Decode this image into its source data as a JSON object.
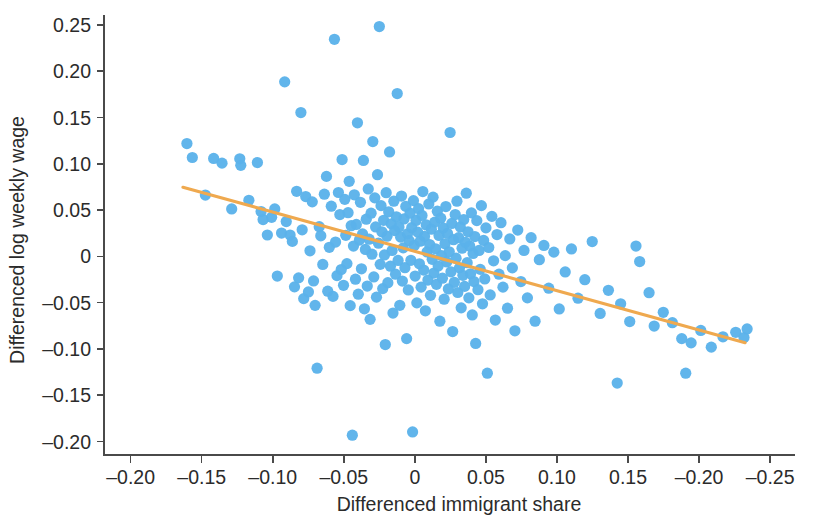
{
  "chart_data": {
    "type": "scatter",
    "title": "",
    "xlabel": "Differenced immigrant share",
    "ylabel": "Differenced log weekly wage",
    "xlim": [
      -0.21875,
      0.2675
    ],
    "ylim": [
      -0.2145,
      0.2607
    ],
    "grid": false,
    "legend": null,
    "point_color": "#5BB2EA",
    "line_color": "#EFA94F",
    "axis_color": "#4A4A4A",
    "text_color": "#2B2B2B",
    "xticks": [
      -0.2,
      -0.15,
      -0.1,
      -0.05,
      0,
      0.05,
      0.1,
      0.15,
      0.2,
      0.25
    ],
    "xtick_labels": [
      "–0.20",
      "–0.15",
      "–0.10",
      "–0.05",
      "0",
      "0.05",
      "0.10",
      "0.15",
      "–0.20",
      "–0.25"
    ],
    "yticks": [
      0.25,
      0.2,
      0.15,
      0.1,
      0.05,
      0,
      -0.05,
      -0.1,
      -0.15,
      -0.2
    ],
    "ytick_labels": [
      "0.25",
      "0.20",
      "0.15",
      "0.10",
      "0.05",
      "0",
      "–0.05",
      "–0.10",
      "–0.15",
      "–0.20"
    ],
    "marker_size": 7.4,
    "fit_line": {
      "label": "linear fit",
      "x_start": -0.1632,
      "y_start": 0.0747,
      "x_end": 0.2324,
      "y_end": -0.0932,
      "slope": -0.4245,
      "intercept": 0.0054
    },
    "series": [
      {
        "name": "labor market cells",
        "n_points": 260,
        "points": [
          [
            -0.1604,
            0.1219
          ],
          [
            -0.1566,
            0.1068
          ],
          [
            -0.1474,
            0.0662
          ],
          [
            -0.1416,
            0.1058
          ],
          [
            -0.1357,
            0.1007
          ],
          [
            -0.1289,
            0.0512
          ],
          [
            -0.1232,
            0.1054
          ],
          [
            -0.1225,
            0.0983
          ],
          [
            -0.1168,
            0.0606
          ],
          [
            -0.1108,
            0.1013
          ],
          [
            -0.1082,
            0.0484
          ],
          [
            -0.1068,
            0.0398
          ],
          [
            -0.1038,
            0.0231
          ],
          [
            -0.1008,
            0.0422
          ],
          [
            -0.0986,
            0.0512
          ],
          [
            -0.0968,
            -0.0212
          ],
          [
            -0.0938,
            0.0252
          ],
          [
            -0.0916,
            0.1885
          ],
          [
            -0.0905,
            0.0376
          ],
          [
            -0.0878,
            0.0231
          ],
          [
            -0.0862,
            0.0162
          ],
          [
            -0.0847,
            -0.0329
          ],
          [
            -0.0832,
            0.0703
          ],
          [
            -0.0818,
            -0.0232
          ],
          [
            -0.0802,
            0.1553
          ],
          [
            -0.0793,
            0.0287
          ],
          [
            -0.0782,
            -0.0456
          ],
          [
            -0.0768,
            0.0646
          ],
          [
            -0.0749,
            -0.0384
          ],
          [
            -0.0738,
            0.006
          ],
          [
            -0.0722,
            0.0589
          ],
          [
            -0.0713,
            -0.0265
          ],
          [
            -0.0702,
            -0.0529
          ],
          [
            -0.0688,
            -0.1208
          ],
          [
            -0.0673,
            0.0321
          ],
          [
            -0.0662,
            0.0222
          ],
          [
            -0.0648,
            -0.0087
          ],
          [
            -0.0637,
            0.0672
          ],
          [
            -0.0622,
            0.0864
          ],
          [
            -0.0613,
            -0.0376
          ],
          [
            -0.0602,
            0.0098
          ],
          [
            -0.0588,
            0.0542
          ],
          [
            -0.0576,
            -0.0432
          ],
          [
            -0.0566,
            0.2345
          ],
          [
            -0.0558,
            0.0155
          ],
          [
            -0.0548,
            -0.0208
          ],
          [
            -0.0538,
            0.069
          ],
          [
            -0.0528,
            0.0452
          ],
          [
            -0.0518,
            -0.0142
          ],
          [
            -0.0512,
            0.1046
          ],
          [
            -0.0502,
            -0.0312
          ],
          [
            -0.0493,
            0.0616
          ],
          [
            -0.0486,
            0.0228
          ],
          [
            -0.0478,
            -0.0078
          ],
          [
            -0.047,
            0.0472
          ],
          [
            -0.0462,
            0.0811
          ],
          [
            -0.0455,
            -0.0532
          ],
          [
            -0.0448,
            0.0331
          ],
          [
            -0.044,
            -0.1931
          ],
          [
            -0.0432,
            0.0112
          ],
          [
            -0.0426,
            0.0665
          ],
          [
            -0.0418,
            -0.0246
          ],
          [
            -0.0412,
            0.0345
          ],
          [
            -0.0404,
            0.1443
          ],
          [
            -0.0398,
            -0.0408
          ],
          [
            -0.039,
            0.0176
          ],
          [
            -0.0383,
            0.0584
          ],
          [
            -0.0376,
            -0.0134
          ],
          [
            -0.0368,
            0.0242
          ],
          [
            -0.0362,
            0.1036
          ],
          [
            -0.0355,
            -0.0566
          ],
          [
            -0.0348,
            0.0075
          ],
          [
            -0.0342,
            0.0402
          ],
          [
            -0.0335,
            -0.032
          ],
          [
            -0.0328,
            0.0728
          ],
          [
            -0.0322,
            0.0186
          ],
          [
            -0.0315,
            -0.068
          ],
          [
            -0.0308,
            0.0466
          ],
          [
            -0.0302,
            0.0024
          ],
          [
            -0.0296,
            0.124
          ],
          [
            -0.0289,
            -0.0222
          ],
          [
            -0.0282,
            0.0632
          ],
          [
            -0.0276,
            0.0318
          ],
          [
            -0.027,
            -0.044
          ],
          [
            -0.0263,
            0.0882
          ],
          [
            -0.0256,
            0.0142
          ],
          [
            -0.025,
            0.2482
          ],
          [
            -0.0244,
            -0.0086
          ],
          [
            -0.0238,
            0.0548
          ],
          [
            -0.0232,
            0.0266
          ],
          [
            -0.0226,
            -0.0348
          ],
          [
            -0.022,
            0.039
          ],
          [
            -0.0214,
            0.0016
          ],
          [
            -0.0208,
            -0.0952
          ],
          [
            -0.0202,
            0.0688
          ],
          [
            -0.0196,
            0.0218
          ],
          [
            -0.019,
            -0.0284
          ],
          [
            -0.0184,
            0.0482
          ],
          [
            -0.0178,
            0.1128
          ],
          [
            -0.0172,
            -0.0106
          ],
          [
            -0.0166,
            0.0352
          ],
          [
            -0.016,
            0.0064
          ],
          [
            -0.0154,
            -0.0612
          ],
          [
            -0.0148,
            0.0596
          ],
          [
            -0.0142,
            0.0278
          ],
          [
            -0.0136,
            -0.0192
          ],
          [
            -0.013,
            0.0428
          ],
          [
            -0.0124,
            0.1759
          ],
          [
            -0.0118,
            -0.0044
          ],
          [
            -0.0112,
            0.0318
          ],
          [
            -0.0106,
            -0.0528
          ],
          [
            -0.01,
            0.0208
          ],
          [
            -0.0094,
            0.0652
          ],
          [
            -0.0088,
            -0.0266
          ],
          [
            -0.0082,
            0.0092
          ],
          [
            -0.0076,
            0.0404
          ],
          [
            -0.007,
            -0.0122
          ],
          [
            -0.0064,
            0.054
          ],
          [
            -0.0058,
            -0.0888
          ],
          [
            -0.0052,
            0.0244
          ],
          [
            -0.0046,
            -0.0362
          ],
          [
            -0.004,
            0.017
          ],
          [
            -0.0034,
            0.0466
          ],
          [
            -0.0028,
            -0.0042
          ],
          [
            -0.0022,
            0.031
          ],
          [
            -0.0016,
            -0.1896
          ],
          [
            -0.001,
            0.0602
          ],
          [
            -0.0004,
            0.0118
          ],
          [
            0.0002,
            -0.0212
          ],
          [
            0.0008,
            0.0388
          ],
          [
            0.0014,
            -0.0502
          ],
          [
            0.002,
            0.0262
          ],
          [
            0.0026,
            0.0516
          ],
          [
            0.0032,
            -0.008
          ],
          [
            0.0038,
            0.0164
          ],
          [
            0.0044,
            -0.0332
          ],
          [
            0.005,
            0.0442
          ],
          [
            0.0056,
            0.07
          ],
          [
            0.0062,
            -0.0148
          ],
          [
            0.0068,
            0.0216
          ],
          [
            0.0074,
            -0.0588
          ],
          [
            0.008,
            0.034
          ],
          [
            0.0086,
            0.0048
          ],
          [
            0.0092,
            -0.0256
          ],
          [
            0.0098,
            0.0566
          ],
          [
            0.0104,
            0.0128
          ],
          [
            0.011,
            -0.042
          ],
          [
            0.0116,
            0.0294
          ],
          [
            0.0122,
            -0.0032
          ],
          [
            0.0128,
            0.064
          ],
          [
            0.0134,
            -0.018
          ],
          [
            0.014,
            0.037
          ],
          [
            0.0146,
            0.0082
          ],
          [
            0.0152,
            -0.0302
          ],
          [
            0.0158,
            0.0488
          ],
          [
            0.0164,
            -0.0104
          ],
          [
            0.017,
            0.0226
          ],
          [
            0.0176,
            -0.07
          ],
          [
            0.0182,
            0.0412
          ],
          [
            0.0188,
            0.0008
          ],
          [
            0.0194,
            -0.0236
          ],
          [
            0.02,
            0.0306
          ],
          [
            0.0206,
            -0.0462
          ],
          [
            0.0212,
            0.0136
          ],
          [
            0.0218,
            0.0538
          ],
          [
            0.0224,
            -0.006
          ],
          [
            0.023,
            0.0248
          ],
          [
            0.0236,
            -0.0352
          ],
          [
            0.0242,
            0.005
          ],
          [
            0.0248,
            0.1338
          ],
          [
            0.0254,
            -0.0166
          ],
          [
            0.026,
            0.0356
          ],
          [
            0.0266,
            -0.0812
          ],
          [
            0.0272,
            0.018
          ],
          [
            0.0278,
            -0.028
          ],
          [
            0.0284,
            0.0452
          ],
          [
            0.029,
            -0.002
          ],
          [
            0.0296,
            0.0596
          ],
          [
            0.0302,
            -0.039
          ],
          [
            0.0308,
            0.0202
          ],
          [
            0.0314,
            -0.0124
          ],
          [
            0.032,
            0.0318
          ],
          [
            0.0326,
            -0.0556
          ],
          [
            0.0332,
            0.0088
          ],
          [
            0.0338,
            -0.0204
          ],
          [
            0.0344,
            0.0398
          ],
          [
            0.035,
            -0.0324
          ],
          [
            0.0356,
            0.0152
          ],
          [
            0.0362,
            0.0682
          ],
          [
            0.0368,
            -0.0068
          ],
          [
            0.0374,
            0.0266
          ],
          [
            0.038,
            -0.0448
          ],
          [
            0.0386,
            0.0112
          ],
          [
            0.0392,
            -0.0188
          ],
          [
            0.0398,
            0.047
          ],
          [
            0.0404,
            -0.0632
          ],
          [
            0.041,
            0.0032
          ],
          [
            0.0416,
            -0.0272
          ],
          [
            0.0422,
            0.0214
          ],
          [
            0.0428,
            -0.094
          ],
          [
            0.0436,
            0.0386
          ],
          [
            0.0444,
            -0.036
          ],
          [
            0.0452,
            0.0064
          ],
          [
            0.046,
            -0.014
          ],
          [
            0.0468,
            0.0548
          ],
          [
            0.0476,
            -0.0512
          ],
          [
            0.0484,
            0.0172
          ],
          [
            0.0492,
            -0.0244
          ],
          [
            0.05,
            0.0308
          ],
          [
            0.051,
            -0.1262
          ],
          [
            0.052,
            0.0096
          ],
          [
            0.053,
            -0.0416
          ],
          [
            0.0542,
            0.0432
          ],
          [
            0.0554,
            -0.0048
          ],
          [
            0.0566,
            -0.0688
          ],
          [
            0.0578,
            0.0236
          ],
          [
            0.0592,
            -0.0192
          ],
          [
            0.0606,
            0.0364
          ],
          [
            0.062,
            -0.0332
          ],
          [
            0.0636,
            0.0008
          ],
          [
            0.0652,
            -0.056
          ],
          [
            0.0668,
            0.0188
          ],
          [
            0.0686,
            -0.0124
          ],
          [
            0.0704,
            -0.0804
          ],
          [
            0.0724,
            0.0284
          ],
          [
            0.0746,
            -0.0272
          ],
          [
            0.0768,
            0.0064
          ],
          [
            0.0792,
            -0.0448
          ],
          [
            0.0818,
            0.0202
          ],
          [
            0.0846,
            -0.07
          ],
          [
            0.0876,
            -0.0036
          ],
          [
            0.0908,
            0.0118
          ],
          [
            0.0942,
            -0.0344
          ],
          [
            0.0978,
            0.0046
          ],
          [
            0.1016,
            -0.0568
          ],
          [
            0.1058,
            -0.0168
          ],
          [
            0.1102,
            0.008
          ],
          [
            0.1148,
            -0.0452
          ],
          [
            0.1196,
            -0.0252
          ],
          [
            0.1248,
            0.016
          ],
          [
            0.1304,
            -0.0616
          ],
          [
            0.1362,
            -0.0366
          ],
          [
            0.1424,
            -0.1368
          ],
          [
            0.1448,
            -0.0512
          ],
          [
            0.1512,
            -0.0704
          ],
          [
            0.1556,
            0.0112
          ],
          [
            0.1582,
            -0.0056
          ],
          [
            0.1648,
            -0.0392
          ],
          [
            0.1684,
            -0.0752
          ],
          [
            0.1748,
            -0.0604
          ],
          [
            0.1812,
            -0.0716
          ],
          [
            0.1878,
            -0.0888
          ],
          [
            0.1906,
            -0.1262
          ],
          [
            0.1944,
            -0.0934
          ],
          [
            0.2012,
            -0.08
          ],
          [
            0.2086,
            -0.098
          ],
          [
            0.2168,
            -0.0868
          ],
          [
            0.2258,
            -0.082
          ],
          [
            0.2316,
            -0.0876
          ],
          [
            0.2338,
            -0.0784
          ]
        ]
      }
    ]
  },
  "axes": {
    "x_axis_name": "x-axis",
    "y_axis_name": "y-axis"
  }
}
